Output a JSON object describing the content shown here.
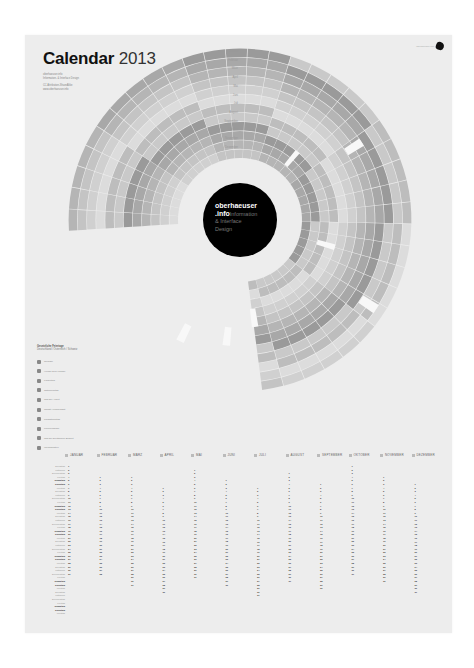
{
  "poster": {
    "title_bold": "Calendar",
    "title_year": "2013",
    "meta_lines": [
      "oberhaeuser.info",
      "Information- & Interface Design",
      "",
      "CC Attribution-ShareAlike",
      "www.oberhaeuser.info"
    ],
    "logo_text": "oberhaeuser.info",
    "center": {
      "line1": "oberhaeuser",
      "line2": ".info",
      "sub1": "Information",
      "sub2": "& Interface",
      "sub3": "Design"
    }
  },
  "spiral": {
    "ring_labels": [
      "Januar",
      "Februar",
      "März",
      "April",
      "Mai",
      "Juni",
      "Juli",
      "August",
      "September",
      "Oktober",
      "November",
      "Dezember"
    ],
    "colors": {
      "light": "#d6d6d6",
      "mid": "#b8b8b8",
      "dark": "#8e8e8e",
      "highlight": "#ffffff",
      "center": "#000000"
    }
  },
  "legend": {
    "heading1": "Gesetzliche Feiertage",
    "heading2": "Deutschland / Österreich / Schweiz",
    "items": [
      {
        "icon": "holiday-icon",
        "label": "Neujahr"
      },
      {
        "icon": "holiday-icon",
        "label": "Heilige Drei Könige"
      },
      {
        "icon": "holiday-icon",
        "label": "Karfreitag"
      },
      {
        "icon": "holiday-icon",
        "label": "Ostermontag"
      },
      {
        "icon": "holiday-icon",
        "label": "Tag der Arbeit"
      },
      {
        "icon": "holiday-icon",
        "label": "Christi Himmelfahrt"
      },
      {
        "icon": "holiday-icon",
        "label": "Pfingstmontag"
      },
      {
        "icon": "holiday-icon",
        "label": "Fronleichnam"
      },
      {
        "icon": "holiday-icon",
        "label": "Tag der Deutschen Einheit"
      },
      {
        "icon": "holiday-icon",
        "label": "Weihnachten"
      }
    ]
  },
  "list": {
    "months": [
      "JANUAR",
      "FEBRUAR",
      "MÄRZ",
      "APRIL",
      "MAI",
      "JUNI",
      "JULI",
      "AUGUST",
      "SEPTEMBER",
      "OKTOBER",
      "NOVEMBER",
      "DEZEMBER"
    ],
    "month_start_weekday": [
      1,
      4,
      4,
      0,
      2,
      5,
      0,
      3,
      6,
      1,
      4,
      6
    ],
    "month_lengths": [
      31,
      28,
      31,
      30,
      31,
      30,
      31,
      31,
      30,
      31,
      30,
      31
    ],
    "weekdays": [
      "Montag",
      "Dienstag",
      "Mittwoch",
      "Donnerstag",
      "Freitag",
      "Samstag",
      "Sonntag"
    ]
  }
}
